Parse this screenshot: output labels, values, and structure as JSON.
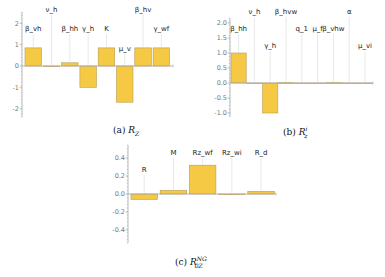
{
  "colors": {
    "bar_fill": "#F6C945",
    "bar_stroke": "#B89A55",
    "axis": "#A8A8A8",
    "leader": "#D8D8D8"
  },
  "chart_data": [
    {
      "id": "a",
      "type": "bar",
      "title": "",
      "caption": {
        "prefix": "(a) ",
        "symbol": "R",
        "sub": "Z",
        "sup": ""
      },
      "categories": [
        "β_vh",
        "ν_h",
        "β_hh",
        "γ_h",
        "K",
        "μ_v",
        "β_hv",
        "γ_wf"
      ],
      "values": [
        0.85,
        0.0,
        0.15,
        -1.0,
        0.85,
        -1.7,
        0.85,
        0.85
      ],
      "yticks": [
        2,
        1,
        0,
        -1,
        -2
      ],
      "ytick_labels": [
        "2",
        "1",
        "0",
        "-1",
        "-2"
      ],
      "ylim": [
        -2.3,
        2.6
      ],
      "xlabel": "",
      "ylabel": "",
      "grid": false
    },
    {
      "id": "b",
      "type": "bar",
      "title": "",
      "caption": {
        "prefix": "(b) ",
        "symbol": "R",
        "sub": "z",
        "sup": "i"
      },
      "categories": [
        "β_hh",
        "ν_h",
        "γ_h",
        "β_hvw",
        "q_1",
        "μ_f",
        "β_vhw",
        "α",
        "μ_vi"
      ],
      "values": [
        1.0,
        0.0,
        -1.0,
        0.01,
        0.0,
        0.0,
        0.01,
        0.0,
        -0.01
      ],
      "yticks": [
        2.0,
        1.5,
        1.0,
        0.5,
        0.0,
        -0.5,
        -1.0
      ],
      "ytick_labels": [
        "2.0",
        "1.5",
        "1.0",
        "0.5",
        "0.0",
        "-0.5",
        "-1.0"
      ],
      "ylim": [
        -1.15,
        2.3
      ],
      "xlabel": "",
      "ylabel": "",
      "grid": false
    },
    {
      "id": "c",
      "type": "bar",
      "title": "",
      "caption": {
        "prefix": "(c) ",
        "symbol": "R",
        "sub": "0Z",
        "sup": "NG"
      },
      "categories": [
        "R",
        "M",
        "Rz_wf",
        "Rz_wi",
        "R_d"
      ],
      "values": [
        -0.06,
        0.04,
        0.32,
        0.0,
        0.03
      ],
      "yticks": [
        0.4,
        0.2,
        0.0,
        -0.2,
        -0.4
      ],
      "ytick_labels": [
        "0.4",
        "0.2",
        "0.0",
        "-0.2",
        "-0.4"
      ],
      "ylim": [
        -0.55,
        0.55
      ],
      "xlabel": "",
      "ylabel": "",
      "grid": false
    }
  ]
}
